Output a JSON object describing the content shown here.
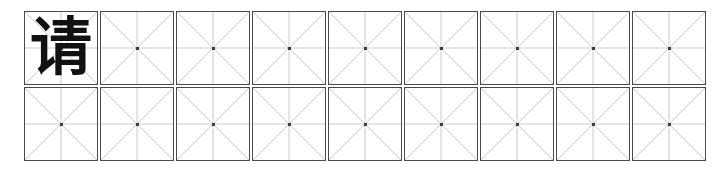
{
  "worksheet": {
    "title": "Chinese character practice grid",
    "script_type": "mizige",
    "background_color": "#ffffff",
    "cell_border_color": "#4a4a4a",
    "guide_line_color": "#bdbdbd",
    "center_dot_color": "#3d3d3d",
    "glyph_color": "#111111",
    "columns": 9,
    "rows": 2,
    "total_cells": 18,
    "grid": [
      {
        "row_index": 1,
        "cells": [
          {
            "character": "请",
            "filled": true
          },
          {
            "character": "",
            "filled": false
          },
          {
            "character": "",
            "filled": false
          },
          {
            "character": "",
            "filled": false
          },
          {
            "character": "",
            "filled": false
          },
          {
            "character": "",
            "filled": false
          },
          {
            "character": "",
            "filled": false
          },
          {
            "character": "",
            "filled": false
          },
          {
            "character": "",
            "filled": false
          }
        ]
      },
      {
        "row_index": 2,
        "cells": [
          {
            "character": "",
            "filled": false
          },
          {
            "character": "",
            "filled": false
          },
          {
            "character": "",
            "filled": false
          },
          {
            "character": "",
            "filled": false
          },
          {
            "character": "",
            "filled": false
          },
          {
            "character": "",
            "filled": false
          },
          {
            "character": "",
            "filled": false
          },
          {
            "character": "",
            "filled": false
          },
          {
            "character": "",
            "filled": false
          }
        ]
      }
    ]
  }
}
